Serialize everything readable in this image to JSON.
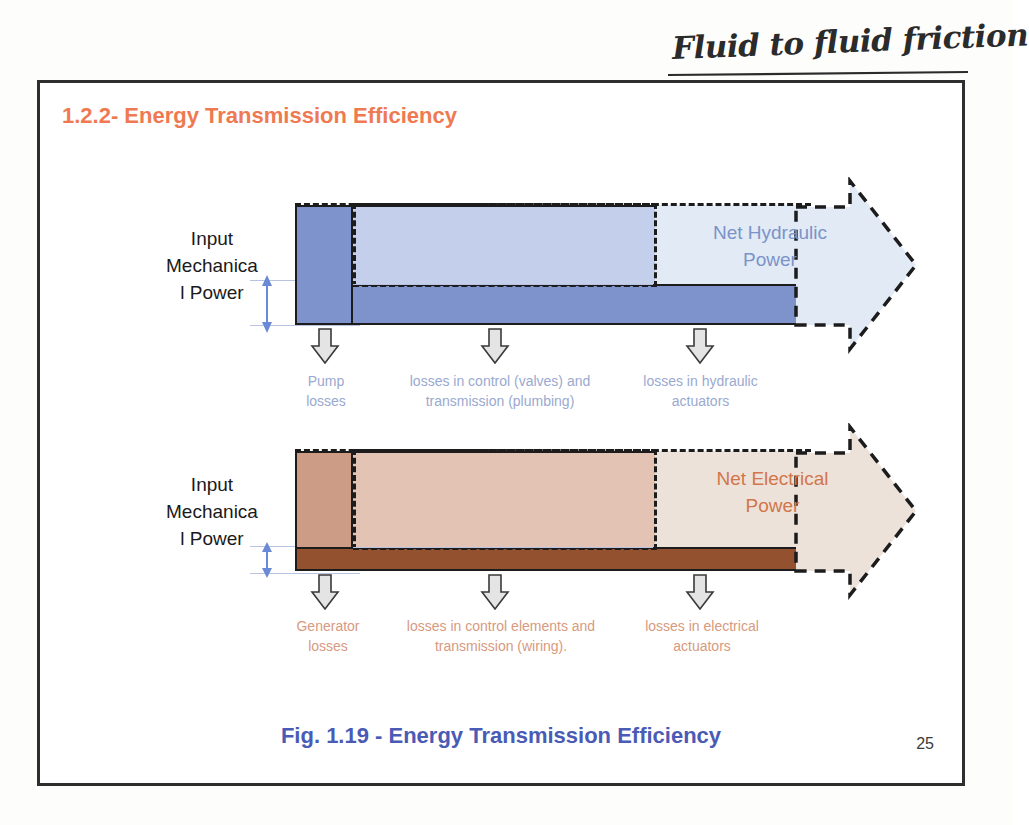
{
  "annotation": {
    "handwritten_note": "Fluid to fluid friction"
  },
  "slide": {
    "title": "1.2.2- Energy Transmission Efficiency",
    "caption": "Fig. 1.19 - Energy Transmission Efficiency",
    "page_number": "25"
  },
  "colors": {
    "title_orange": "#ef7a51",
    "caption_blue": "#4a5bb5",
    "hydraulic_dark_blue": "#7e93cc",
    "hydraulic_mid_blue": "#c3cfeb",
    "hydraulic_light_blue": "#e2eaf6",
    "electrical_dark_brown": "#93512f",
    "electrical_mid_salmon": "#dcb1a0",
    "electrical_light": "#ede2da",
    "loss_arrow_fill": "#e4e4e4",
    "outline": "#1c1c1c",
    "measure_blue": "#6b8ad6"
  },
  "hydraulic": {
    "input_label": "Input Mechanica l Power",
    "input_label_lines": [
      "Input",
      "Mechanica",
      "l Power"
    ],
    "net_power_label": "Net Hydraulic Power",
    "net_power_lines": [
      "Net Hydraulic",
      "Power"
    ],
    "losses": [
      {
        "lines": [
          "Pump",
          "losses"
        ]
      },
      {
        "lines": [
          "losses in control (valves) and",
          "transmission (plumbing)"
        ]
      },
      {
        "lines": [
          "losses in hydraulic",
          "actuators"
        ]
      }
    ]
  },
  "electrical": {
    "input_label": "Input Mechanica l Power",
    "input_label_lines": [
      "Input",
      "Mechanica",
      "l Power"
    ],
    "net_power_label": "Net Electrical Power",
    "net_power_lines": [
      "Net Electrical",
      "Power"
    ],
    "losses": [
      {
        "lines": [
          "Generator",
          "losses"
        ]
      },
      {
        "lines": [
          "losses in control elements and",
          "transmission (wiring)."
        ]
      },
      {
        "lines": [
          "losses in electrical",
          "actuators"
        ]
      }
    ]
  }
}
